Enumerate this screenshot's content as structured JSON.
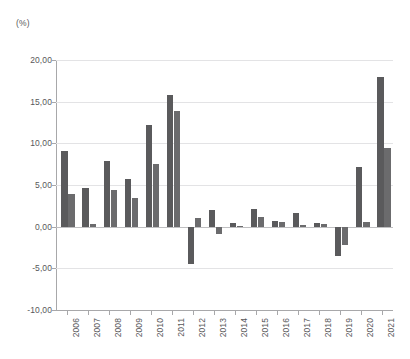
{
  "chart_data": {
    "type": "bar",
    "title": "",
    "subtitle": "",
    "xlabel": "",
    "ylabel": "(%)",
    "unit_label": "(%)",
    "grid": true,
    "legend_position": "none",
    "ylim": [
      -10.0,
      20.0
    ],
    "ytick_labels": [
      "20,00",
      "15,00",
      "10,00",
      "5,00",
      "0,00",
      "-5,00",
      "-10,00"
    ],
    "ytick_values": [
      20.0,
      15.0,
      10.0,
      5.0,
      0.0,
      -5.0,
      -10.0
    ],
    "categories": [
      "2006",
      "2007",
      "2008",
      "2009",
      "2010",
      "2011",
      "2012",
      "2013",
      "2014",
      "2015",
      "2016",
      "2017",
      "2018",
      "2019",
      "2020",
      "2021"
    ],
    "series": [
      {
        "name": "series-1",
        "color": "#5a5a5c",
        "values": [
          9.1,
          4.7,
          7.9,
          5.7,
          12.2,
          15.8,
          -4.5,
          2.0,
          0.4,
          2.1,
          0.7,
          1.6,
          0.4,
          -3.5,
          7.2,
          18.0
        ]
      },
      {
        "name": "series-2",
        "color": "#6b6b6d",
        "values": [
          3.9,
          0.3,
          4.4,
          3.5,
          7.5,
          13.9,
          1.1,
          -0.9,
          0.1,
          1.2,
          0.6,
          0.2,
          0.3,
          -2.2,
          0.6,
          9.5
        ]
      }
    ]
  }
}
